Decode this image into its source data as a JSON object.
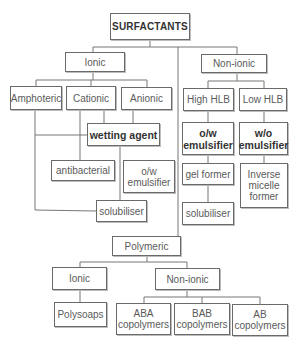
{
  "diagram": {
    "root": "SURFACTANTS",
    "ionic": {
      "label": "Ionic",
      "children": [
        "Amphoteric",
        "Cationic",
        "Anionic"
      ],
      "wetting_agent": "wetting agent",
      "antibacterial": "antibacterial",
      "ow_emulsifier": "o/w emulsifier",
      "solubiliser": "solubiliser"
    },
    "nonionic": {
      "label": "Non-ionic",
      "high_hlb": "High HLB",
      "low_hlb": "Low HLB",
      "ow_emulsifier": "o/w emulsifier",
      "wo_emulsifier": "w/o emulsifier",
      "gel_former": "gel former",
      "inverse_micelle": "Inverse micelle former",
      "solubiliser": "solubiliser"
    },
    "polymeric": {
      "label": "Polymeric",
      "ionic": "Ionic",
      "polysoaps": "Polysoaps",
      "nonionic": "Non-ionic",
      "copolymers": [
        "ABA copolymers",
        "BAB copolymers",
        "AB copolymers"
      ]
    }
  }
}
